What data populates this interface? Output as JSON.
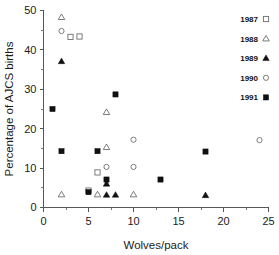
{
  "chart_data": {
    "type": "scatter",
    "title": "",
    "xlabel": "Wolves/pack",
    "ylabel": "Percentage of AJCS births",
    "xlim": [
      0,
      25
    ],
    "ylim": [
      0,
      50
    ],
    "xticks": [
      0,
      5,
      10,
      15,
      20,
      25
    ],
    "yticks": [
      0,
      10,
      20,
      30,
      40,
      50
    ],
    "xtick_labels": [
      "0",
      "5",
      "10",
      "15",
      "20",
      "25"
    ],
    "ytick_labels": [
      "0",
      "10",
      "20",
      "30",
      "40",
      "50"
    ],
    "x_minor_step": 2.5,
    "y_minor_step": 5,
    "grid": false,
    "legend_position": "top-right",
    "series": [
      {
        "name": "1987",
        "marker": "open-square",
        "points": [
          {
            "x": 3,
            "y": 43.3
          },
          {
            "x": 4,
            "y": 43.4
          },
          {
            "x": 5,
            "y": 4.3
          },
          {
            "x": 6,
            "y": 8.9
          }
        ]
      },
      {
        "name": "1988",
        "marker": "open-triangle",
        "points": [
          {
            "x": 2,
            "y": 48.3
          },
          {
            "x": 2,
            "y": 3.3
          },
          {
            "x": 6,
            "y": 3.3
          },
          {
            "x": 7,
            "y": 24.2
          },
          {
            "x": 7,
            "y": 15.3
          },
          {
            "x": 10,
            "y": 3.3
          }
        ]
      },
      {
        "name": "1989",
        "marker": "filled-triangle",
        "points": [
          {
            "x": 2,
            "y": 37.1
          },
          {
            "x": 7,
            "y": 6.0
          },
          {
            "x": 7,
            "y": 3.2
          },
          {
            "x": 8,
            "y": 3.2
          },
          {
            "x": 18,
            "y": 3.1
          }
        ]
      },
      {
        "name": "1990",
        "marker": "open-circle",
        "points": [
          {
            "x": 2,
            "y": 44.8
          },
          {
            "x": 7,
            "y": 10.3
          },
          {
            "x": 10,
            "y": 17.2
          },
          {
            "x": 10,
            "y": 10.3
          },
          {
            "x": 24,
            "y": 17.1
          }
        ]
      },
      {
        "name": "1991",
        "marker": "filled-square",
        "points": [
          {
            "x": 1,
            "y": 25.0
          },
          {
            "x": 2,
            "y": 14.3
          },
          {
            "x": 5,
            "y": 3.9
          },
          {
            "x": 6,
            "y": 14.3
          },
          {
            "x": 7,
            "y": 7.1
          },
          {
            "x": 8,
            "y": 28.7
          },
          {
            "x": 13,
            "y": 7.1
          },
          {
            "x": 18,
            "y": 14.2
          }
        ]
      }
    ]
  },
  "legend": {
    "entries": [
      {
        "label": "1987",
        "marker": "open-square"
      },
      {
        "label": "1988",
        "marker": "open-triangle"
      },
      {
        "label": "1989",
        "marker": "filled-triangle"
      },
      {
        "label": "1990",
        "marker": "open-circle"
      },
      {
        "label": "1991",
        "marker": "filled-square"
      }
    ]
  },
  "colors": {
    "axis": "#565656",
    "text": "#1b1b1b",
    "open_marker_stroke": "#6e6e6e",
    "filled_marker": "#101010",
    "background": "#ffffff"
  }
}
